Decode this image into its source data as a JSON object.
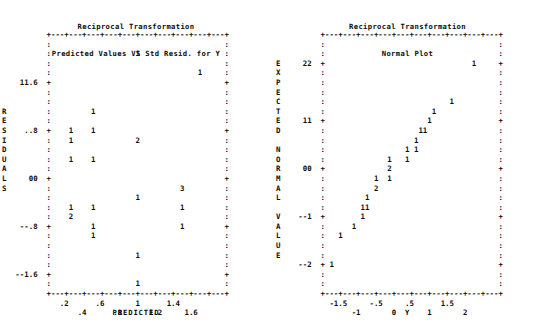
{
  "page": {
    "background_color": "#ffffff",
    "text_color": "#101010",
    "width": 543,
    "height": 328
  },
  "panels": [
    {
      "id": "predicted-vs-residual",
      "title_line1": "Reciprocal Transformation",
      "title_line2": "Predicted Values VS Std Resid. for Y",
      "x_axis_title": "PREDICTED",
      "y_axis_title": "RESIDUALS",
      "y_axis_letters": [
        "R",
        "E",
        "S",
        "I",
        "D",
        "U",
        "A",
        "L",
        "S"
      ],
      "y_tick_labels": [
        "1.6",
        ".8",
        "0",
        "-.8",
        "-1.6"
      ],
      "x_tick_labels_upper": [
        ".2",
        ".6",
        "1",
        "1.4"
      ],
      "x_tick_labels_lower": [
        ".4",
        ".8",
        "1.2",
        "1.6"
      ],
      "plot_rows": [
        "          +---+---+---+---+---+---+---+---+---+---+",
        "          :                                       :",
        "          :                   1                   :",
        "          :                                       :",
        "          :                                 1     :",
        "    1.6   +                                       +",
        "          :                                       :",
        "          :                                       :",
        "          :         1                             :",
        "          :                                       :",
        "     .8   +    1    1                             +",
        "          :    1              2                   :",
        "          :                                       :",
        "          :    1    1                             :",
        "          :                                       :",
        "      0   +                                       +",
        "          :                             3         :",
        "          :                   1                   :",
        "          :    1    1                   1         :",
        "          :    2                                  :",
        "    -.8   +         1                   1         +",
        "          :         1                             :",
        "          :                                       :",
        "          :                   1                   :",
        "          :                                       :",
        "   -1.6   +                                       +",
        "          :                   1                   :",
        "          +---+---+---+---+---+---+---+---+---+---+"
      ],
      "data_points": [
        {
          "x": 1.0,
          "y": 2.1,
          "count": 1
        },
        {
          "x": 1.6,
          "y": 1.85,
          "count": 1
        },
        {
          "x": 0.55,
          "y": 1.05,
          "count": 1
        },
        {
          "x": 0.3,
          "y": 0.8,
          "count": 1
        },
        {
          "x": 0.55,
          "y": 0.8,
          "count": 1
        },
        {
          "x": 0.3,
          "y": 0.65,
          "count": 1
        },
        {
          "x": 1.0,
          "y": 0.65,
          "count": 2
        },
        {
          "x": 0.3,
          "y": 0.35,
          "count": 1
        },
        {
          "x": 0.55,
          "y": 0.35,
          "count": 1
        },
        {
          "x": 1.45,
          "y": -0.2,
          "count": 3
        },
        {
          "x": 1.0,
          "y": -0.35,
          "count": 1
        },
        {
          "x": 0.3,
          "y": -0.5,
          "count": 1
        },
        {
          "x": 0.55,
          "y": -0.5,
          "count": 1
        },
        {
          "x": 1.45,
          "y": -0.5,
          "count": 1
        },
        {
          "x": 0.3,
          "y": -0.65,
          "count": 2
        },
        {
          "x": 0.55,
          "y": -0.8,
          "count": 1
        },
        {
          "x": 1.45,
          "y": -0.8,
          "count": 1
        },
        {
          "x": 0.55,
          "y": -0.95,
          "count": 1
        },
        {
          "x": 1.0,
          "y": -1.25,
          "count": 1
        },
        {
          "x": 1.0,
          "y": -1.75,
          "count": 1
        }
      ]
    },
    {
      "id": "normal-plot",
      "title_line1": "Reciprocal Transformation",
      "title_line2": "Normal Plot",
      "x_axis_title": "Y",
      "y_axis_title": "EXPECTED NORMAL VALUE",
      "y_axis_letters": [
        "E",
        "X",
        "P",
        "E",
        "C",
        "T",
        "E",
        "D",
        "",
        "N",
        "O",
        "R",
        "M",
        "A",
        "L",
        "",
        "V",
        "A",
        "L",
        "U",
        "E"
      ],
      "y_tick_labels": [
        "2",
        "1",
        "0",
        "-1",
        "-2"
      ],
      "x_tick_labels_upper": [
        "-1.5",
        "-.5",
        ".5",
        "1.5"
      ],
      "x_tick_labels_lower": [
        "-1",
        "0",
        "1",
        "2"
      ],
      "plot_rows": [
        "          +---+---+---+---+---+---+---+---+---+---+",
        "          :                                       :",
        "          :                                       :",
        "      2   +                                 1     +",
        "          :                                       :",
        "          :                                       :",
        "          :                                       :",
        "          :                            1          :",
        "          :                        1              :",
        "      1   +                       1               +",
        "          :                     11                :",
        "          :                    1                  :",
        "          :                  1 1                  :",
        "          :              1   1                    :",
        "      0   +              2                        +",
        "          :           1  1                        :",
        "          :           2                           :",
        "          :         1                             :",
        "          :        11                             :",
        "     -1   +        1                              +",
        "          :      1                                :",
        "          :   1                                   :",
        "          :                                       :",
        "          :                                       :",
        "     -2   + 1                                     +",
        "          :                                       :",
        "          :                                       :",
        "          +---+---+---+---+---+---+---+---+---+---+"
      ],
      "data_points": [
        {
          "x": 1.75,
          "y": 2.0,
          "count": 1
        },
        {
          "x": 1.3,
          "y": 1.4,
          "count": 1
        },
        {
          "x": 0.95,
          "y": 1.25,
          "count": 1
        },
        {
          "x": 0.8,
          "y": 1.1,
          "count": 1
        },
        {
          "x": 0.6,
          "y": 0.85,
          "count": 1
        },
        {
          "x": 0.7,
          "y": 0.85,
          "count": 1
        },
        {
          "x": 0.5,
          "y": 0.7,
          "count": 1
        },
        {
          "x": 0.3,
          "y": 0.55,
          "count": 1
        },
        {
          "x": 0.5,
          "y": 0.55,
          "count": 1
        },
        {
          "x": -0.1,
          "y": 0.4,
          "count": 1
        },
        {
          "x": 0.3,
          "y": 0.4,
          "count": 1
        },
        {
          "x": -0.1,
          "y": 0.2,
          "count": 2
        },
        {
          "x": -0.4,
          "y": 0.05,
          "count": 1
        },
        {
          "x": -0.1,
          "y": 0.05,
          "count": 1
        },
        {
          "x": -0.4,
          "y": -0.1,
          "count": 2
        },
        {
          "x": -0.65,
          "y": -0.35,
          "count": 1
        },
        {
          "x": -0.75,
          "y": -0.5,
          "count": 1
        },
        {
          "x": -0.65,
          "y": -0.5,
          "count": 1
        },
        {
          "x": -0.75,
          "y": -0.7,
          "count": 1
        },
        {
          "x": -1.0,
          "y": -0.9,
          "count": 1
        },
        {
          "x": -1.3,
          "y": -1.15,
          "count": 1
        },
        {
          "x": -1.65,
          "y": -2.0,
          "count": 1
        }
      ]
    }
  ],
  "chart_data": [
    {
      "type": "scatter",
      "title": "Reciprocal Transformation / Predicted Values VS Std Resid. for Y",
      "xlabel": "PREDICTED",
      "ylabel": "RESIDUALS",
      "xlim": [
        0.1,
        1.8
      ],
      "ylim": [
        -2.0,
        2.4
      ],
      "xticks": [
        0.2,
        0.4,
        0.6,
        0.8,
        1.0,
        1.2,
        1.4,
        1.6
      ],
      "yticks": [
        -1.6,
        -0.8,
        0,
        0.8,
        1.6
      ],
      "grid": false,
      "legend": "none",
      "x": [
        1.0,
        1.6,
        0.55,
        0.3,
        0.55,
        0.3,
        1.0,
        0.3,
        0.55,
        1.45,
        1.0,
        0.3,
        0.55,
        1.45,
        0.3,
        0.55,
        1.45,
        0.55,
        1.0,
        1.0
      ],
      "y": [
        2.1,
        1.85,
        1.05,
        0.8,
        0.8,
        0.65,
        0.65,
        0.35,
        0.35,
        -0.2,
        -0.35,
        -0.5,
        -0.5,
        -0.5,
        -0.65,
        -0.8,
        -0.8,
        -0.95,
        -1.25,
        -1.75
      ],
      "counts": [
        1,
        1,
        1,
        1,
        1,
        1,
        2,
        1,
        1,
        3,
        1,
        1,
        1,
        1,
        2,
        1,
        1,
        1,
        1,
        1
      ]
    },
    {
      "type": "scatter",
      "title": "Reciprocal Transformation / Normal Plot",
      "xlabel": "Y",
      "ylabel": "EXPECTED NORMAL VALUE",
      "xlim": [
        -1.9,
        2.2
      ],
      "ylim": [
        -2.4,
        2.4
      ],
      "xticks": [
        -1.5,
        -1,
        -0.5,
        0,
        0.5,
        1,
        1.5,
        2
      ],
      "yticks": [
        -2,
        -1,
        0,
        1,
        2
      ],
      "grid": false,
      "legend": "none",
      "x": [
        1.75,
        1.3,
        0.95,
        0.8,
        0.6,
        0.7,
        0.5,
        0.3,
        0.5,
        -0.1,
        0.3,
        -0.1,
        -0.4,
        -0.1,
        -0.4,
        -0.65,
        -0.75,
        -0.65,
        -0.75,
        -1.0,
        -1.3,
        -1.65
      ],
      "y": [
        2.0,
        1.4,
        1.25,
        1.1,
        0.85,
        0.85,
        0.7,
        0.55,
        0.55,
        0.4,
        0.4,
        0.2,
        0.05,
        0.05,
        -0.1,
        -0.35,
        -0.5,
        -0.5,
        -0.7,
        -0.9,
        -1.15,
        -2.0
      ],
      "counts": [
        1,
        1,
        1,
        1,
        1,
        1,
        1,
        1,
        1,
        1,
        1,
        2,
        1,
        1,
        2,
        1,
        1,
        1,
        1,
        1,
        1,
        1
      ]
    }
  ]
}
